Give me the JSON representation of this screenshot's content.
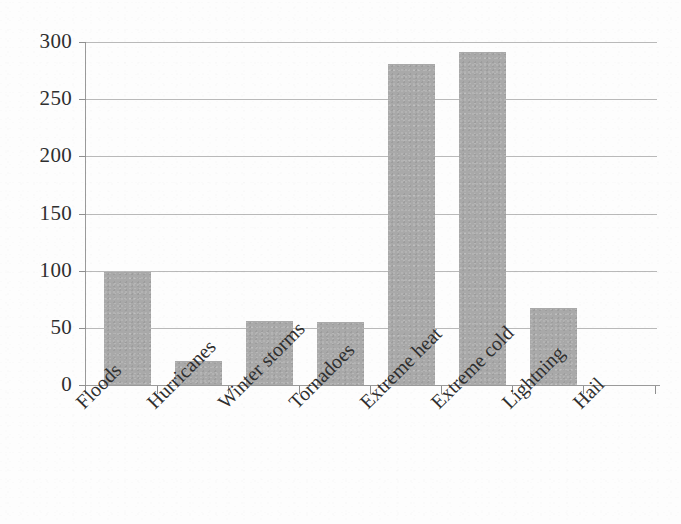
{
  "chart_data": {
    "type": "bar",
    "title": "",
    "subtitle": "",
    "xlabel": "",
    "ylabel": "",
    "categories": [
      "Floods",
      "Hurricanes",
      "Winter storms",
      "Tornadoes",
      "Extreme heat",
      "Extreme cold",
      "Lightning",
      "Hail"
    ],
    "values": [
      99,
      21,
      56,
      55,
      281,
      291,
      67,
      0
    ],
    "ylim": [
      0,
      300
    ],
    "yticks": [
      0,
      50,
      100,
      150,
      200,
      250,
      300
    ],
    "ytick_labels": [
      "0",
      "50",
      "100",
      "150",
      "200",
      "250",
      "300"
    ],
    "grid": true,
    "grid_axis": "y",
    "legend": false,
    "legend_position": "none",
    "bar_color": "#a9a9a9",
    "gridline_color": "#b9b9b9",
    "axis_color": "#9a9a9a",
    "background_color": "#fdfdfd",
    "text_color": "#2f2f2f",
    "xtick_label_rotation": -45
  },
  "axes": {
    "y": {
      "ticks": [
        {
          "label": "300",
          "value": 300
        },
        {
          "label": "250",
          "value": 250
        },
        {
          "label": "200",
          "value": 200
        },
        {
          "label": "150",
          "value": 150
        },
        {
          "label": "100",
          "value": 100
        },
        {
          "label": "50",
          "value": 50
        },
        {
          "label": "0",
          "value": 0
        }
      ]
    },
    "x": {
      "ticks": [
        {
          "label": "Floods"
        },
        {
          "label": "Hurricanes"
        },
        {
          "label": "Winter storms"
        },
        {
          "label": "Tornadoes"
        },
        {
          "label": "Extreme heat"
        },
        {
          "label": "Extreme cold"
        },
        {
          "label": "Lightning"
        },
        {
          "label": "Hail"
        }
      ]
    }
  }
}
